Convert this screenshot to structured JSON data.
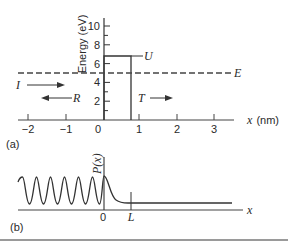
{
  "panel_a": {
    "label": "(a)",
    "y_axis": {
      "title": "Energy (eV)",
      "ticks": [
        "2",
        "4",
        "6",
        "8",
        "10"
      ],
      "tick_values": [
        2,
        4,
        6,
        8,
        10
      ],
      "range": [
        0,
        11
      ]
    },
    "x_axis": {
      "title": "x (nm)",
      "ticks": [
        "−2",
        "−1",
        "0",
        "1",
        "2",
        "3"
      ],
      "tick_values": [
        -2,
        -1,
        0,
        1,
        2,
        3
      ],
      "range": [
        -2.3,
        3.5
      ]
    },
    "barrier": {
      "label": "U",
      "height_eV": 7,
      "x_start_nm": 0,
      "x_end_nm": 0.75
    },
    "energy_level": {
      "label": "E",
      "value_eV": 5,
      "style": "dashed"
    },
    "arrows": {
      "incident": "I",
      "reflected": "R",
      "transmitted": "T"
    }
  },
  "panel_b": {
    "label": "(b)",
    "y_axis_title": "P(x)",
    "x_axis_title": "x",
    "x_ticks": [
      "0",
      "L"
    ],
    "description": "Oscillating probability density for x<0, exponential decay inside barrier 0<x<L, constant for x>L"
  }
}
